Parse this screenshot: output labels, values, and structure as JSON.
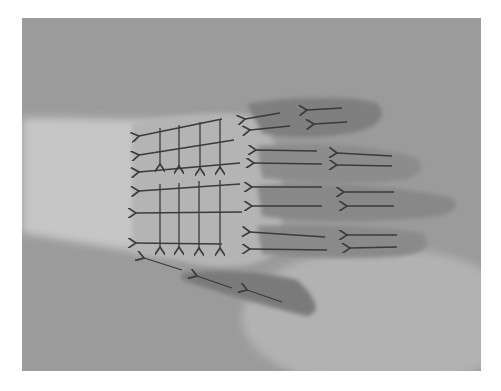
{
  "image": {
    "alt": "Grayscale photo of the back of a hand lying flat, fingers pointing right, with drawn arrows pointing left along each finger and a grid of horizontal left arrows and vertical downward arrows over the back of the hand",
    "colors": {
      "background": "#9a9a9a",
      "hand_light": "#c8c8c8",
      "hand_shadow": "#6e6e6e",
      "arrow": "#3a3a3a",
      "page": "#ffffff"
    },
    "regions": {
      "fingers": 4,
      "thumb": 1,
      "grid_blocks": 2
    }
  }
}
